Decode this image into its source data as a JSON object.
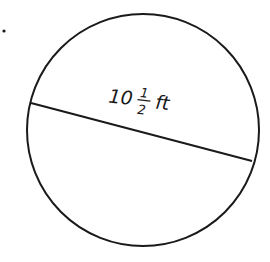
{
  "diagram": {
    "shape": "circle",
    "bullet": ".",
    "measure": {
      "whole": "10",
      "numerator": "1",
      "denominator": "2",
      "unit": "ft"
    },
    "segment": "diameter",
    "colors": {
      "stroke": "#1a1a1a",
      "background": "#ffffff"
    }
  }
}
